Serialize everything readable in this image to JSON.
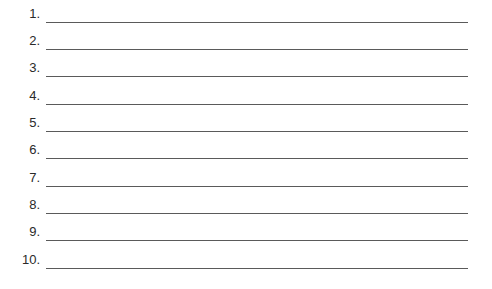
{
  "worksheet": {
    "items": [
      {
        "number": "1.",
        "value": ""
      },
      {
        "number": "2.",
        "value": ""
      },
      {
        "number": "3.",
        "value": ""
      },
      {
        "number": "4.",
        "value": ""
      },
      {
        "number": "5.",
        "value": ""
      },
      {
        "number": "6.",
        "value": ""
      },
      {
        "number": "7.",
        "value": ""
      },
      {
        "number": "8.",
        "value": ""
      },
      {
        "number": "9.",
        "value": ""
      },
      {
        "number": "10.",
        "value": ""
      }
    ],
    "line_color": "#5a5a5a",
    "text_color": "#2a2a2a"
  }
}
